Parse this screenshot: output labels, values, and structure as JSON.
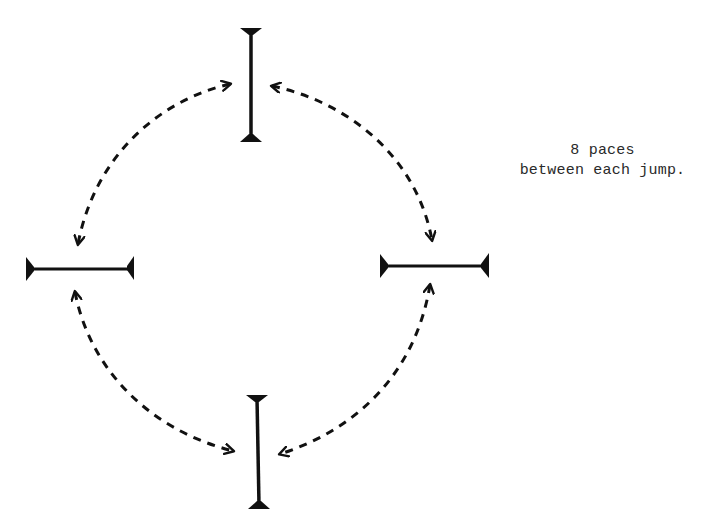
{
  "diagram": {
    "type": "jumping-grid-course",
    "note": {
      "line1": "8 paces",
      "line2": "between each jump."
    },
    "jumps": [
      {
        "id": "top",
        "orientation": "vertical",
        "x1": 251,
        "y1": 29,
        "x2": 251,
        "y2": 141
      },
      {
        "id": "left",
        "orientation": "horizontal",
        "x1": 27,
        "y1": 269,
        "x2": 133,
        "y2": 269
      },
      {
        "id": "right",
        "orientation": "horizontal",
        "x1": 381,
        "y1": 266,
        "x2": 487,
        "y2": 266
      },
      {
        "id": "bottom",
        "orientation": "vertical",
        "x1": 257,
        "y1": 396,
        "x2": 259,
        "y2": 507
      }
    ],
    "arrows": [
      {
        "id": "top-left",
        "from": "top",
        "to": "left",
        "bidirectional": true,
        "style": "dashed"
      },
      {
        "id": "top-right",
        "from": "top",
        "to": "right",
        "bidirectional": true,
        "style": "dashed"
      },
      {
        "id": "bottom-left",
        "from": "bottom",
        "to": "left",
        "bidirectional": true,
        "style": "dashed"
      },
      {
        "id": "bottom-right",
        "from": "bottom",
        "to": "right",
        "bidirectional": true,
        "style": "dashed"
      }
    ],
    "colors": {
      "ink": "#111111",
      "background": "#ffffff"
    }
  }
}
